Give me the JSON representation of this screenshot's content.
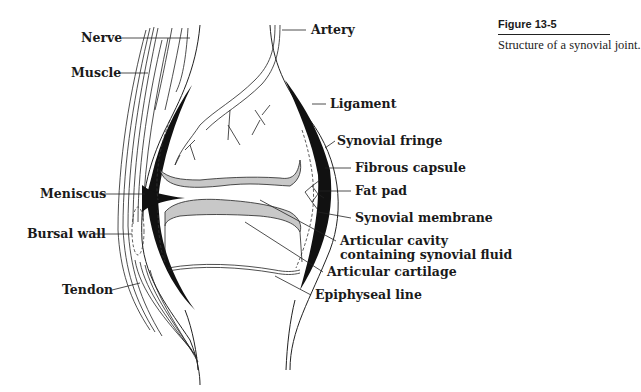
{
  "figure": {
    "number": "Figure 13-5",
    "caption": "Structure of a synovial joint."
  },
  "labels": {
    "left": [
      {
        "text": "Nerve",
        "x": 81,
        "y": 42
      },
      {
        "text": "Muscle",
        "x": 71,
        "y": 77
      },
      {
        "text": "Meniscus",
        "x": 40,
        "y": 198
      },
      {
        "text": "Bursal wall",
        "x": 27,
        "y": 238
      },
      {
        "text": "Tendon",
        "x": 62,
        "y": 294
      }
    ],
    "right": [
      {
        "text": "Artery",
        "x": 311,
        "y": 34
      },
      {
        "text": "Ligament",
        "x": 330,
        "y": 108
      },
      {
        "text": "Synovial fringe",
        "x": 337,
        "y": 145
      },
      {
        "text": "Fibrous capsule",
        "x": 355,
        "y": 172
      },
      {
        "text": "Fat pad",
        "x": 355,
        "y": 195
      },
      {
        "text": "Synovial membrane",
        "x": 355,
        "y": 222
      },
      {
        "text": "Articular cavity",
        "x": 340,
        "y": 245
      },
      {
        "text": "containing synovial fluid",
        "x": 340,
        "y": 259
      },
      {
        "text": "Articular cartilage",
        "x": 327,
        "y": 276
      },
      {
        "text": "Epiphyseal line",
        "x": 315,
        "y": 299
      }
    ]
  },
  "colors": {
    "ink": "#1a1a1a",
    "cartilage": "#c8c8c8",
    "background": "#ffffff"
  }
}
